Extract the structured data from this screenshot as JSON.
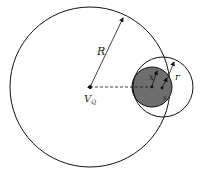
{
  "diagram": {
    "labels": {
      "big_radius": "R",
      "center": "V",
      "center_sub": "Q",
      "x": "x",
      "small_radius": "r",
      "s": "s"
    },
    "colors": {
      "stroke": "#111111",
      "fill_shaded": "#6e6e6e",
      "background": "#ffffff"
    }
  }
}
